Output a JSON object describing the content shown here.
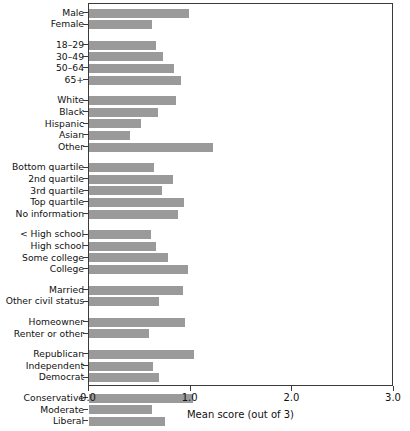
{
  "chart_data": {
    "type": "bar",
    "orientation": "horizontal",
    "title": "",
    "xlabel": "Mean score (out of 3)",
    "ylabel": "",
    "xlim": [
      0.0,
      3.0
    ],
    "xticks": [
      "0.0",
      "1.0",
      "2.0",
      "3.0"
    ],
    "xtick_values": [
      0.0,
      1.0,
      2.0,
      3.0
    ],
    "grid": false,
    "legend": null,
    "bar_color": "#9a9a9a",
    "frame_color": "#3a3a3a",
    "groups": [
      {
        "name": "gender",
        "categories": [
          "Male",
          "Female"
        ],
        "values": [
          0.98,
          0.62
        ]
      },
      {
        "name": "age",
        "categories": [
          "18–29",
          "30–49",
          "50–64",
          "65+"
        ],
        "values": [
          0.66,
          0.73,
          0.84,
          0.9
        ]
      },
      {
        "name": "race",
        "categories": [
          "White",
          "Black",
          "Hispanic",
          "Asian",
          "Other"
        ],
        "values": [
          0.86,
          0.68,
          0.51,
          0.4,
          1.22
        ]
      },
      {
        "name": "income",
        "categories": [
          "Bottom quartile",
          "2nd quartile",
          "3rd quartile",
          "Top quartile",
          "No information"
        ],
        "values": [
          0.64,
          0.83,
          0.72,
          0.93,
          0.88
        ]
      },
      {
        "name": "education",
        "categories": [
          "< High school",
          "High school",
          "Some college",
          "College"
        ],
        "values": [
          0.61,
          0.66,
          0.78,
          0.97
        ]
      },
      {
        "name": "civil-status",
        "categories": [
          "Married",
          "Other civil status"
        ],
        "values": [
          0.92,
          0.69
        ]
      },
      {
        "name": "housing",
        "categories": [
          "Homeowner",
          "Renter or other"
        ],
        "values": [
          0.94,
          0.59
        ]
      },
      {
        "name": "party",
        "categories": [
          "Republican",
          "Independent",
          "Democrat"
        ],
        "values": [
          1.03,
          0.63,
          0.69
        ]
      },
      {
        "name": "ideology",
        "categories": [
          "Conservative",
          "Moderate",
          "Liberal"
        ],
        "values": [
          1.02,
          0.62,
          0.75
        ]
      }
    ]
  }
}
